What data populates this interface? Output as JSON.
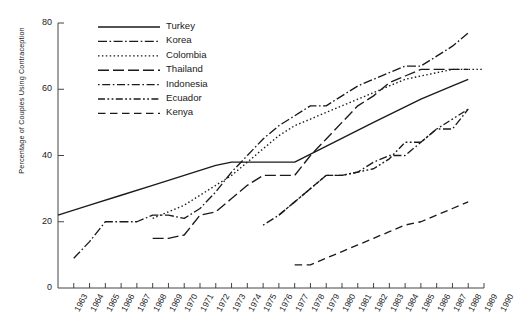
{
  "cut_header": "— — —   — — —",
  "axes": {
    "ylabel": "Percentage of Couples Using Contraception",
    "yticks": [
      "0",
      "20",
      "40",
      "60",
      "80"
    ],
    "xticks": [
      "1963",
      "1964",
      "1965",
      "1966",
      "1967",
      "1968",
      "1969",
      "1970",
      "1971",
      "1972",
      "1973",
      "1974",
      "1975",
      "1976",
      "1977",
      "1978",
      "1979",
      "1980",
      "1981",
      "1982",
      "1983",
      "1984",
      "1985",
      "1986",
      "1987",
      "1988",
      "1989",
      "1990"
    ]
  },
  "legend": {
    "entries": [
      {
        "label": "Turkey",
        "style": "solid"
      },
      {
        "label": "Korea",
        "style": "dashdot"
      },
      {
        "label": "Colombia",
        "style": "dotted"
      },
      {
        "label": "Thailand",
        "style": "longdash"
      },
      {
        "label": "Indonesia",
        "style": "dotdash"
      },
      {
        "label": "Ecuador",
        "style": "dashdotdot"
      },
      {
        "label": "Kenya",
        "style": "dashed"
      }
    ]
  },
  "chart_data": {
    "type": "line",
    "title": "",
    "xlabel": "",
    "ylabel": "Percentage of Couples Using Contraception",
    "xlim": [
      1963,
      1990
    ],
    "ylim": [
      0,
      80
    ],
    "yticks": [
      0,
      20,
      40,
      60,
      80
    ],
    "grid": false,
    "legend_position": "upper-left-inside",
    "x": [
      1963,
      1964,
      1965,
      1966,
      1967,
      1968,
      1969,
      1970,
      1971,
      1972,
      1973,
      1974,
      1975,
      1976,
      1977,
      1978,
      1979,
      1980,
      1981,
      1982,
      1983,
      1984,
      1985,
      1986,
      1987,
      1988,
      1989,
      1990
    ],
    "series": [
      {
        "name": "Turkey",
        "dash": "solid",
        "points": [
          [
            1963,
            22
          ],
          [
            1965,
            25
          ],
          [
            1967,
            28
          ],
          [
            1969,
            31
          ],
          [
            1971,
            34
          ],
          [
            1973,
            37
          ],
          [
            1974,
            38
          ],
          [
            1975,
            38
          ],
          [
            1977,
            38
          ],
          [
            1978,
            38
          ],
          [
            1983,
            50
          ],
          [
            1986,
            57
          ],
          [
            1988,
            61
          ],
          [
            1989,
            63
          ]
        ]
      },
      {
        "name": "Korea",
        "dash": "dashdot",
        "points": [
          [
            1964,
            9
          ],
          [
            1965,
            14
          ],
          [
            1966,
            20
          ],
          [
            1967,
            20
          ],
          [
            1968,
            20
          ],
          [
            1969,
            22
          ],
          [
            1970,
            22
          ],
          [
            1971,
            21
          ],
          [
            1972,
            24
          ],
          [
            1973,
            29
          ],
          [
            1974,
            35
          ],
          [
            1975,
            40
          ],
          [
            1976,
            45
          ],
          [
            1977,
            49
          ],
          [
            1978,
            52
          ],
          [
            1979,
            55
          ],
          [
            1980,
            55
          ],
          [
            1981,
            58
          ],
          [
            1982,
            61
          ],
          [
            1983,
            63
          ],
          [
            1984,
            65
          ],
          [
            1985,
            67
          ],
          [
            1986,
            67
          ],
          [
            1987,
            70
          ],
          [
            1988,
            73
          ],
          [
            1989,
            77
          ]
        ]
      },
      {
        "name": "Colombia",
        "dash": "dotted",
        "points": [
          [
            1969,
            21
          ],
          [
            1970,
            23
          ],
          [
            1971,
            25
          ],
          [
            1972,
            28
          ],
          [
            1973,
            31
          ],
          [
            1974,
            34
          ],
          [
            1975,
            38
          ],
          [
            1976,
            42
          ],
          [
            1977,
            46
          ],
          [
            1978,
            49
          ],
          [
            1979,
            51
          ],
          [
            1980,
            53
          ],
          [
            1981,
            55
          ],
          [
            1982,
            57
          ],
          [
            1983,
            59
          ],
          [
            1984,
            61
          ],
          [
            1985,
            63
          ],
          [
            1986,
            64
          ],
          [
            1987,
            65
          ],
          [
            1988,
            66
          ],
          [
            1989,
            66
          ],
          [
            1990,
            66
          ]
        ]
      },
      {
        "name": "Thailand",
        "dash": "longdash",
        "points": [
          [
            1969,
            15
          ],
          [
            1970,
            15
          ],
          [
            1971,
            16
          ],
          [
            1972,
            22
          ],
          [
            1973,
            23
          ],
          [
            1974,
            27
          ],
          [
            1975,
            31
          ],
          [
            1976,
            34
          ],
          [
            1977,
            34
          ],
          [
            1978,
            34
          ],
          [
            1979,
            40
          ],
          [
            1980,
            45
          ],
          [
            1981,
            50
          ],
          [
            1982,
            55
          ],
          [
            1983,
            58
          ],
          [
            1984,
            62
          ],
          [
            1985,
            64
          ],
          [
            1986,
            66
          ],
          [
            1988,
            66
          ],
          [
            1989,
            66
          ]
        ]
      },
      {
        "name": "Indonesia",
        "dash": "dotdash",
        "points": [
          [
            1976,
            19
          ],
          [
            1977,
            22
          ],
          [
            1978,
            26
          ],
          [
            1979,
            30
          ],
          [
            1980,
            34
          ],
          [
            1981,
            34
          ],
          [
            1982,
            35
          ],
          [
            1983,
            38
          ],
          [
            1984,
            40
          ],
          [
            1985,
            40
          ],
          [
            1986,
            44
          ],
          [
            1987,
            48
          ],
          [
            1988,
            48
          ],
          [
            1989,
            54
          ]
        ]
      },
      {
        "name": "Ecuador",
        "dash": "dashdotdot",
        "points": [
          [
            1977,
            22
          ],
          [
            1979,
            30
          ],
          [
            1980,
            34
          ],
          [
            1981,
            34
          ],
          [
            1982,
            35
          ],
          [
            1983,
            36
          ],
          [
            1984,
            39
          ],
          [
            1985,
            44
          ],
          [
            1986,
            44
          ],
          [
            1987,
            48
          ],
          [
            1988,
            51
          ],
          [
            1989,
            54
          ]
        ]
      },
      {
        "name": "Kenya",
        "dash": "dashed",
        "points": [
          [
            1978,
            7
          ],
          [
            1979,
            7
          ],
          [
            1980,
            9
          ],
          [
            1981,
            11
          ],
          [
            1982,
            13
          ],
          [
            1983,
            15
          ],
          [
            1984,
            17
          ],
          [
            1985,
            19
          ],
          [
            1986,
            20
          ],
          [
            1987,
            22
          ],
          [
            1988,
            24
          ],
          [
            1989,
            26
          ]
        ]
      }
    ]
  }
}
